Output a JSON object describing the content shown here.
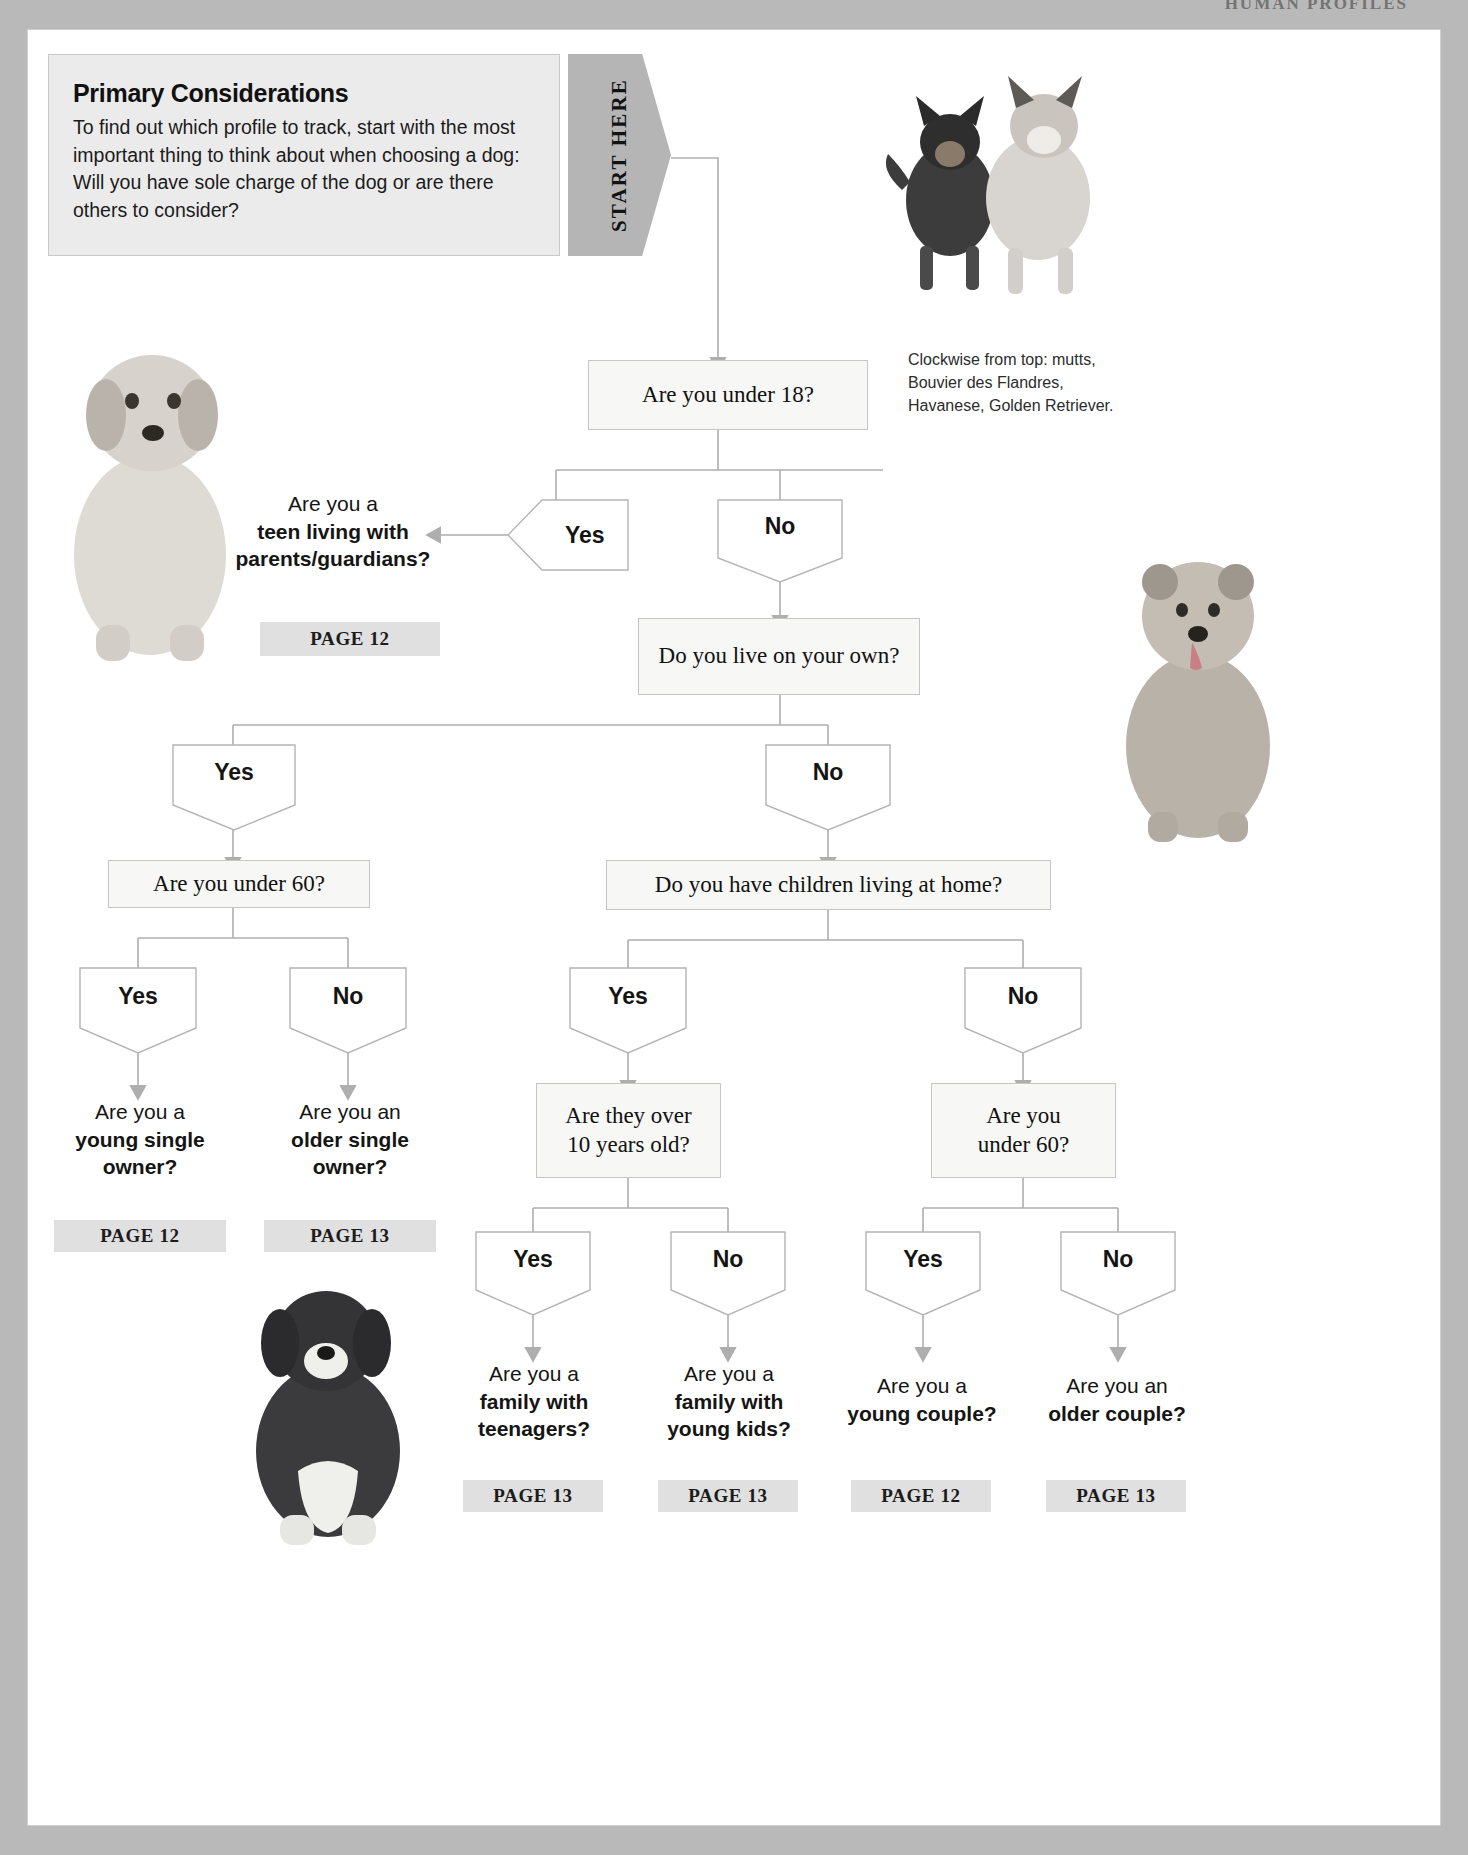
{
  "running_head": "HUMAN PROFILES",
  "intro": {
    "title": "Primary Considerations",
    "body": "To find out which profile to track, start with the most important thing to think about when choosing a dog: Will you have sole charge of the dog or are there others to consider?"
  },
  "start_here": {
    "label": "START HERE"
  },
  "photo_caption": "Clockwise from top: mutts, Bouvier des Flandres, Havanese, Golden Retriever.",
  "answers": {
    "yes": "Yes",
    "no": "No"
  },
  "questions": {
    "under18": "Are you under 18?",
    "live_on_own": "Do you live on your own?",
    "under60_left": "Are you under 60?",
    "children_at_home": "Do you have children living at home?",
    "over10": "Are they over\n10 years old?",
    "over10_l1": "Are they over",
    "over10_l2": "10 years old?",
    "under60_right_l1": "Are you",
    "under60_right_l2": "under 60?"
  },
  "results": {
    "teen": {
      "lead": "Are you a",
      "strong_l1": "teen living with",
      "strong_l2": "parents/guardians?",
      "page": "PAGE 12"
    },
    "young_single": {
      "lead": "Are you a",
      "strong_l1": "young single",
      "strong_l2": "owner?",
      "page": "PAGE 12"
    },
    "older_single": {
      "lead": "Are you an",
      "strong_l1": "older single",
      "strong_l2": "owner?",
      "page": "PAGE 13"
    },
    "family_teen": {
      "lead": "Are you a",
      "strong_l1": "family with",
      "strong_l2": "teenagers?",
      "page": "PAGE 13"
    },
    "family_young": {
      "lead": "Are you a",
      "strong_l1": "family with",
      "strong_l2": "young kids?",
      "page": "PAGE 13"
    },
    "young_couple": {
      "lead": "Are you a",
      "strong_l1": "young couple?",
      "strong_l2": "",
      "page": "PAGE 12"
    },
    "older_couple": {
      "lead": "Are you an",
      "strong_l1": "older couple?",
      "strong_l2": "",
      "page": "PAGE 13"
    }
  },
  "colors": {
    "panel_gray": "#ebebeb",
    "pennant_gray": "#b5b5b5",
    "chip_gray": "#e0e0e0",
    "box_fill": "#f7f7f5",
    "line_gray": "#aeaeae"
  }
}
